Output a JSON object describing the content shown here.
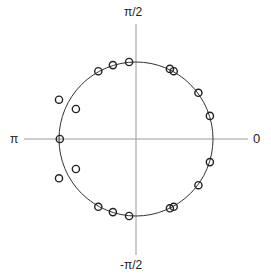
{
  "chart_data": {
    "type": "scatter",
    "title": "",
    "subtitle": "Pole-zero style plot on the complex plane with unit circle",
    "xlabel": "",
    "ylabel": "",
    "axis_labels": {
      "top": "π/2",
      "bottom": "-π/2",
      "left": "π",
      "right": "0"
    },
    "grid": false,
    "legend": null,
    "unit_circle": {
      "cx": 0,
      "cy": 0,
      "r": 1
    },
    "xlim": [
      -1.45,
      1.45
    ],
    "ylim": [
      -1.5,
      1.5
    ],
    "marker": "open-circle",
    "points": [
      {
        "x": -0.09,
        "y": 1.0
      },
      {
        "x": -0.3,
        "y": 0.96
      },
      {
        "x": -0.49,
        "y": 0.88
      },
      {
        "x": 0.44,
        "y": 0.91
      },
      {
        "x": 0.49,
        "y": 0.88
      },
      {
        "x": 0.81,
        "y": 0.6
      },
      {
        "x": 0.96,
        "y": 0.3
      },
      {
        "x": 0.96,
        "y": -0.3
      },
      {
        "x": 0.81,
        "y": -0.6
      },
      {
        "x": 0.49,
        "y": -0.88
      },
      {
        "x": 0.44,
        "y": -0.9
      },
      {
        "x": -0.09,
        "y": -1.0
      },
      {
        "x": -0.3,
        "y": -0.95
      },
      {
        "x": -0.49,
        "y": -0.88
      },
      {
        "x": -0.99,
        "y": 0.0
      },
      {
        "x": -1.0,
        "y": 0.51
      },
      {
        "x": -0.78,
        "y": 0.39
      },
      {
        "x": -1.0,
        "y": -0.51
      },
      {
        "x": -0.78,
        "y": -0.39
      }
    ]
  },
  "render": {
    "center": [
      136,
      139
    ],
    "radius_px": 77,
    "axis_x_extent": [
      24,
      248
    ],
    "axis_y_extent": [
      24,
      255
    ],
    "line_color": "#999999",
    "circle_color": "#333333",
    "marker_color": "#222222"
  }
}
